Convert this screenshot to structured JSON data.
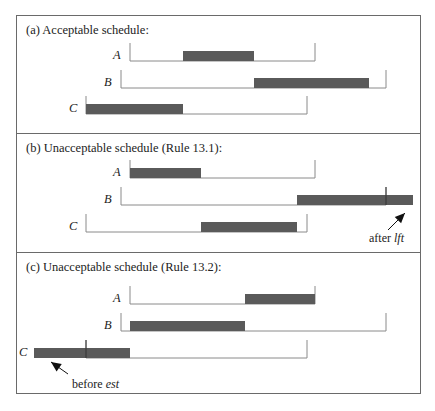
{
  "figure": {
    "panels": [
      {
        "title": "(a) Acceptable schedule:",
        "rows": [
          {
            "label": "A",
            "window_start_x": 130,
            "window_end_x": 315,
            "bar_start_x": 183,
            "bar_end_x": 254
          },
          {
            "label": "B",
            "window_start_x": 121,
            "window_end_x": 386,
            "bar_start_x": 254,
            "bar_end_x": 369
          },
          {
            "label": "C",
            "window_start_x": 86,
            "window_end_x": 307,
            "bar_start_x": 86,
            "bar_end_x": 183
          }
        ]
      },
      {
        "title": "(b) Unacceptable schedule (Rule 13.1):",
        "rows": [
          {
            "label": "A",
            "window_start_x": 130,
            "window_end_x": 315,
            "bar_start_x": 130,
            "bar_end_x": 201
          },
          {
            "label": "B",
            "window_start_x": 121,
            "window_end_x": 386,
            "bar_start_x": 297,
            "bar_end_x": 413
          },
          {
            "label": "C",
            "window_start_x": 86,
            "window_end_x": 307,
            "bar_start_x": 201,
            "bar_end_x": 297
          }
        ],
        "annotation": {
          "prefix": "after ",
          "term": "lft"
        }
      },
      {
        "title": "(c) Unacceptable schedule (Rule 13.2):",
        "rows": [
          {
            "label": "A",
            "window_start_x": 130,
            "window_end_x": 315,
            "bar_start_x": 245,
            "bar_end_x": 315
          },
          {
            "label": "B",
            "window_start_x": 121,
            "window_end_x": 386,
            "bar_start_x": 130,
            "bar_end_x": 245
          },
          {
            "label": "C",
            "window_start_x": 86,
            "window_end_x": 307,
            "bar_start_x": 34,
            "bar_end_x": 130
          }
        ],
        "annotation": {
          "prefix": "before ",
          "term": "est"
        }
      }
    ],
    "colors": {
      "bar": "#5a5a5a",
      "line": "#8a8a8a",
      "frame": "#6a6a6a",
      "text": "#222222"
    }
  }
}
